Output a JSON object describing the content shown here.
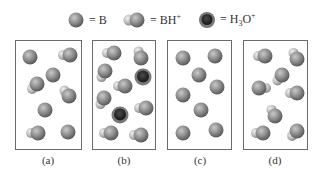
{
  "legend": {
    "items": [
      {
        "icon": "base-sphere-icon",
        "text": "= B"
      },
      {
        "icon": "conjugate-acid-dimer-icon",
        "text": "= BH",
        "sup": "+"
      },
      {
        "icon": "hydronium-icon",
        "text": "= H",
        "sub": "3",
        "text2": "O",
        "sup": "+"
      }
    ]
  },
  "panels": [
    {
      "label": "(a)",
      "x": 15,
      "width": 67,
      "molecules": [
        {
          "type": "B",
          "x": 30,
          "y": 57
        },
        {
          "type": "BH",
          "x": 70,
          "y": 55,
          "angle": 180
        },
        {
          "type": "B",
          "x": 53,
          "y": 75
        },
        {
          "type": "BH",
          "x": 37,
          "y": 84,
          "angle": 135
        },
        {
          "type": "BH",
          "x": 69,
          "y": 96,
          "angle": -130
        },
        {
          "type": "B",
          "x": 45,
          "y": 110
        },
        {
          "type": "BH",
          "x": 38,
          "y": 133,
          "angle": 180
        },
        {
          "type": "B",
          "x": 68,
          "y": 132
        }
      ]
    },
    {
      "label": "(b)",
      "x": 92,
      "width": 64,
      "molecules": [
        {
          "type": "BH",
          "x": 114,
          "y": 53,
          "angle": 180
        },
        {
          "type": "BH",
          "x": 141,
          "y": 58,
          "angle": -110
        },
        {
          "type": "BH",
          "x": 105,
          "y": 71,
          "angle": 120
        },
        {
          "type": "H3O",
          "x": 143,
          "y": 77
        },
        {
          "type": "BH",
          "x": 125,
          "y": 86,
          "angle": 180
        },
        {
          "type": "BH",
          "x": 104,
          "y": 98,
          "angle": 120
        },
        {
          "type": "H3O",
          "x": 120,
          "y": 115
        },
        {
          "type": "BH",
          "x": 146,
          "y": 108,
          "angle": 180
        },
        {
          "type": "BH",
          "x": 111,
          "y": 133,
          "angle": 180
        },
        {
          "type": "BH",
          "x": 141,
          "y": 135,
          "angle": 180
        }
      ]
    },
    {
      "label": "(c)",
      "x": 167,
      "width": 65,
      "molecules": [
        {
          "type": "B",
          "x": 183,
          "y": 58
        },
        {
          "type": "B",
          "x": 215,
          "y": 56
        },
        {
          "type": "B",
          "x": 199,
          "y": 75
        },
        {
          "type": "B",
          "x": 217,
          "y": 87
        },
        {
          "type": "B",
          "x": 183,
          "y": 95
        },
        {
          "type": "B",
          "x": 201,
          "y": 110
        },
        {
          "type": "B",
          "x": 183,
          "y": 133
        },
        {
          "type": "B",
          "x": 216,
          "y": 130
        }
      ]
    },
    {
      "label": "(d)",
      "x": 243,
      "width": 65,
      "molecules": [
        {
          "type": "BH",
          "x": 265,
          "y": 56,
          "angle": 180
        },
        {
          "type": "BH",
          "x": 297,
          "y": 59,
          "angle": -120
        },
        {
          "type": "BH",
          "x": 282,
          "y": 75,
          "angle": 130
        },
        {
          "type": "BH",
          "x": 259,
          "y": 88,
          "angle": 0
        },
        {
          "type": "BH",
          "x": 297,
          "y": 93,
          "angle": 180
        },
        {
          "type": "BH",
          "x": 275,
          "y": 116,
          "angle": -120
        },
        {
          "type": "BH",
          "x": 263,
          "y": 133,
          "angle": 180
        },
        {
          "type": "BH",
          "x": 297,
          "y": 131,
          "angle": 135
        }
      ]
    }
  ],
  "colors": {
    "sphere_light": "#b8b8b8",
    "sphere_mid": "#8a8a8a",
    "sphere_dark": "#5e5e5e",
    "hydrogen_light": "#e0e0e0",
    "hydronium_core": "#2d2d2d",
    "border": "#6b6b6b"
  }
}
